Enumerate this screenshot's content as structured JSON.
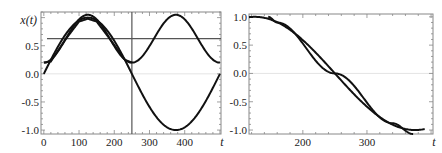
{
  "chart_data": [
    {
      "type": "line",
      "title": "",
      "xlabel": "t",
      "ylabel": "x(t)",
      "xlim": [
        -8,
        503
      ],
      "ylim": [
        -1.07,
        1.1
      ],
      "xticks": [
        0,
        100,
        200,
        300,
        400
      ],
      "xtick_labels": [
        "0",
        "100",
        "200",
        "300",
        "400"
      ],
      "yticks": [
        -1.0,
        -0.5,
        0.0,
        0.5
      ],
      "ytick_labels": [
        "-1.0",
        "-0.5",
        "0.0",
        "0.5"
      ],
      "grid": false,
      "zero_line": true,
      "reference_lines": [
        {
          "orientation": "vertical",
          "value": 250
        },
        {
          "orientation": "horizontal",
          "value": 0.625
        }
      ],
      "series": [
        {
          "name": "sine",
          "function": "sin(2*pi*t/500)",
          "x_range": [
            0,
            500
          ],
          "samples": [
            [
              0,
              0.0
            ],
            [
              62.5,
              0.707
            ],
            [
              125,
              1.0
            ],
            [
              187.5,
              0.707
            ],
            [
              250,
              0.0
            ],
            [
              312.5,
              -0.707
            ],
            [
              375,
              -1.0
            ],
            [
              437.5,
              -0.707
            ],
            [
              500,
              0.0
            ]
          ]
        },
        {
          "name": "oscillating",
          "function": "0.625 - 0.425*cos(4*pi*t/500)",
          "x_range": [
            0,
            500
          ],
          "samples": [
            [
              0,
              0.2
            ],
            [
              62.5,
              0.625
            ],
            [
              125,
              1.05
            ],
            [
              187.5,
              0.625
            ],
            [
              250,
              0.2
            ],
            [
              312.5,
              0.625
            ],
            [
              375,
              1.05
            ],
            [
              437.5,
              0.625
            ],
            [
              500,
              0.2
            ]
          ]
        },
        {
          "name": "approximation",
          "x_range": [
            0,
            250
          ],
          "samples": [
            [
              0,
              0.2
            ],
            [
              20,
              0.22
            ],
            [
              60,
              0.6
            ],
            [
              100,
              0.93
            ],
            [
              125,
              0.98
            ],
            [
              150,
              0.93
            ],
            [
              190,
              0.6
            ],
            [
              230,
              0.25
            ],
            [
              250,
              0.2
            ]
          ]
        }
      ]
    },
    {
      "type": "line",
      "title": "",
      "xlabel": "t",
      "ylabel": "",
      "xlim": [
        116,
        403
      ],
      "ylim": [
        -1.07,
        1.05
      ],
      "xticks": [
        200,
        300
      ],
      "xtick_labels": [
        "200",
        "300"
      ],
      "yticks": [
        -1.0,
        -0.5,
        0.0,
        0.5,
        1.0
      ],
      "ytick_labels": [
        "-1.0",
        "-0.5",
        "0.0",
        "0.5",
        "1.0"
      ],
      "grid": false,
      "zero_line": true,
      "series": [
        {
          "name": "cosine",
          "function": "cos(2*pi*(t-125)/500)",
          "x_range": [
            116,
            390
          ],
          "samples": [
            [
              116,
              1.0
            ],
            [
              150,
              0.95
            ],
            [
              187.5,
              0.707
            ],
            [
              250,
              0.0
            ],
            [
              312.5,
              -0.707
            ],
            [
              350,
              -0.95
            ],
            [
              375,
              -1.0
            ],
            [
              390,
              -1.0
            ]
          ]
        },
        {
          "name": "linear-approx",
          "x_range": [
            146,
            372
          ],
          "samples": [
            [
              146,
              1.0
            ],
            [
              160,
              0.9
            ],
            [
              250,
              0.0
            ],
            [
              340,
              -0.88
            ],
            [
              372,
              -1.07
            ]
          ]
        }
      ]
    }
  ]
}
